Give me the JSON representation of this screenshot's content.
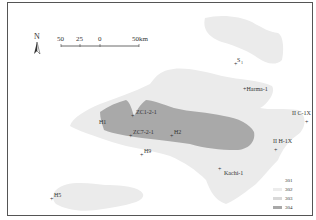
{
  "north_arrow": {
    "label": "N"
  },
  "scale_bar": {
    "ticks": [
      "50",
      "25",
      "0",
      "50km"
    ]
  },
  "wells": [
    {
      "name": "S1",
      "label": "S",
      "sub": "1",
      "x": 238,
      "y": 62
    },
    {
      "name": "Harma-1",
      "label": "+Harma-1",
      "x": 246,
      "y": 88
    },
    {
      "name": "ZC1-2-1",
      "label": "ZC1-2-1",
      "x": 131,
      "y": 113
    },
    {
      "name": "H1",
      "label": "H1",
      "x": 99,
      "y": 124
    },
    {
      "name": "ZC7-2-1",
      "label": "ZC7-2-1",
      "x": 129,
      "y": 134
    },
    {
      "name": "H2",
      "label": "H2",
      "x": 171,
      "y": 136
    },
    {
      "name": "H9",
      "label": "H9",
      "x": 141,
      "y": 154
    },
    {
      "name": "IIC-1X",
      "label": "II C-1X",
      "x": 307,
      "y": 116
    },
    {
      "name": "IIH-1X",
      "label": "II H-1X",
      "x": 276,
      "y": 150
    },
    {
      "name": "Kachi-1",
      "label": "Kachi-1",
      "x": 220,
      "y": 172
    },
    {
      "name": "H5",
      "label": "H5",
      "x": 51,
      "y": 199
    }
  ],
  "legend": {
    "items": [
      {
        "code": "301",
        "color": "#ffffff"
      },
      {
        "code": "302",
        "color": "#ececec"
      },
      {
        "code": "303",
        "color": "#d8d8d8"
      },
      {
        "code": "304",
        "color": "#a8a8a8"
      }
    ]
  },
  "colors": {
    "zone302": "#ebebeb",
    "zone303": "#e0e0e0",
    "zone304": "#a9a9a9"
  }
}
